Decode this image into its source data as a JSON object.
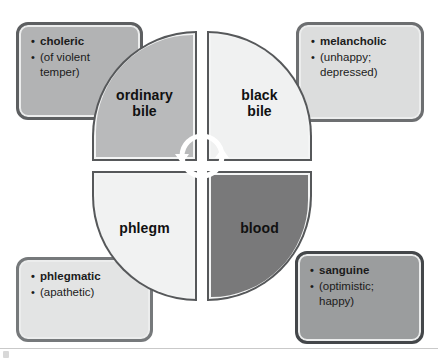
{
  "diagram": {
    "center_icon": "cyclical-double-arrow-icon",
    "quadrants": [
      {
        "id": "ordinary-bile",
        "label_line1": "ordinary",
        "label_line2": "bile",
        "color": "#b9babb"
      },
      {
        "id": "black-bile",
        "label_line1": "black",
        "label_line2": "bile",
        "color": "#f0f1f1"
      },
      {
        "id": "phlegm",
        "label_line1": "phlegm",
        "label_line2": "",
        "color": "#f1f2f2"
      },
      {
        "id": "blood",
        "label_line1": "blood",
        "label_line2": "",
        "color": "#79797a"
      }
    ],
    "boxes": [
      {
        "id": "choleric",
        "position": "top-left",
        "color": "#b2b3b4",
        "line1": "choleric",
        "line2": "(of violent",
        "line3": "temper)"
      },
      {
        "id": "melancholic",
        "position": "top-right",
        "color": "#dcdddd",
        "line1": "melancholic",
        "line2": "(unhappy;",
        "line3": "depressed)"
      },
      {
        "id": "phlegmatic",
        "position": "bottom-left",
        "color": "#e3e4e4",
        "line1": "phlegmatic",
        "line2": "(apathetic)",
        "line3": ""
      },
      {
        "id": "sanguine",
        "position": "bottom-right",
        "color": "#9b9d9e",
        "line1": "sanguine",
        "line2": "(optimistic;",
        "line3": "happy)"
      }
    ]
  }
}
